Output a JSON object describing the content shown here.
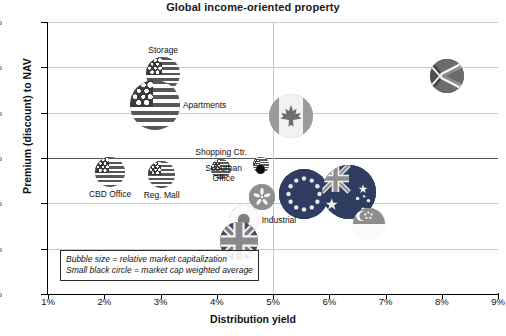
{
  "chart_data": {
    "type": "scatter",
    "title": "Global income-oriented property",
    "xlabel": "Distribution yield",
    "ylabel": "Premium (discount) to NAV",
    "xlim": [
      1,
      9
    ],
    "ylim": [
      -30,
      30
    ],
    "x_ticks": [
      "1%",
      "2%",
      "3%",
      "4%",
      "5%",
      "6%",
      "7%",
      "8%",
      "9%"
    ],
    "y_ticks": [
      "30%",
      "20%",
      "10%",
      "0%",
      "-10%",
      "-20%",
      "-30%"
    ],
    "grid": "both",
    "legend_position": "inside-bottom-left",
    "notes": [
      "Bubble size = relative market capitalization",
      "Small black circle = market cap weighted average"
    ],
    "bubbles": [
      {
        "label": "Storage",
        "flag": "us",
        "x": 3.05,
        "y": 18.6,
        "size": 34,
        "label_pos": "top"
      },
      {
        "label": "Apartments",
        "flag": "us",
        "x": 2.9,
        "y": 11.6,
        "size": 50,
        "label_pos": "right"
      },
      {
        "label": "",
        "flag": "ca",
        "x": 5.32,
        "y": 9.3,
        "size": 44,
        "label_pos": "none"
      },
      {
        "label": "",
        "flag": "za",
        "x": 8.1,
        "y": 18.0,
        "size": 34,
        "label_pos": "none"
      },
      {
        "label": "CBD Office",
        "flag": "us",
        "x": 2.1,
        "y": -3.0,
        "size": 30,
        "label_pos": "bottom"
      },
      {
        "label": "Reg. Mall",
        "flag": "us",
        "x": 3.02,
        "y": -3.6,
        "size": 27,
        "label_pos": "bottom"
      },
      {
        "label": "Shopping Ctr.",
        "flag": "us",
        "x": 4.08,
        "y": -2.4,
        "size": 20,
        "label_pos": "top"
      },
      {
        "label": "Suburban Office",
        "flag": "us",
        "x": 4.78,
        "y": -1.6,
        "size": 16,
        "label_pos": "left2"
      },
      {
        "label": "",
        "flag": "hk",
        "x": 4.8,
        "y": -8.6,
        "size": 26,
        "label_pos": "none"
      },
      {
        "label": "",
        "flag": "eu",
        "x": 5.55,
        "y": -8.0,
        "size": 50,
        "label_pos": "none"
      },
      {
        "label": "",
        "flag": "au",
        "x": 6.35,
        "y": -7.6,
        "size": 54,
        "label_pos": "none"
      },
      {
        "label": "",
        "flag": "sg",
        "x": 6.7,
        "y": -14.6,
        "size": 32,
        "label_pos": "none"
      },
      {
        "label": "Industrial",
        "flag": "jp",
        "x": 4.48,
        "y": -13.6,
        "size": 30,
        "label_pos": "right"
      },
      {
        "label": "",
        "flag": "uk",
        "x": 4.4,
        "y": -18.4,
        "size": 38,
        "label_pos": "none"
      }
    ],
    "average_marker": {
      "x": 4.77,
      "y": -2.6,
      "size": 7
    }
  },
  "colors": {
    "axis": "#000000",
    "grid": "#c9c9c9",
    "zero_line": "#555555",
    "text": "#111111",
    "marker": "#0d0d0d"
  }
}
